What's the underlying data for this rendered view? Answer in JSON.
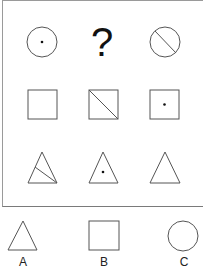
{
  "puzzle": {
    "question_mark": "?",
    "grid": [
      [
        {
          "shape": "circle",
          "mark": "dot"
        },
        {
          "shape": "unknown",
          "mark": "question"
        },
        {
          "shape": "circle",
          "mark": "diagonal-line"
        }
      ],
      [
        {
          "shape": "square",
          "mark": "none"
        },
        {
          "shape": "square",
          "mark": "diagonal-line"
        },
        {
          "shape": "square",
          "mark": "dot"
        }
      ],
      [
        {
          "shape": "triangle",
          "mark": "line"
        },
        {
          "shape": "triangle",
          "mark": "dot"
        },
        {
          "shape": "triangle",
          "mark": "none"
        }
      ]
    ]
  },
  "options": [
    {
      "label": "A",
      "shape": "triangle"
    },
    {
      "label": "B",
      "shape": "square"
    },
    {
      "label": "C",
      "shape": "circle"
    }
  ],
  "colors": {
    "stroke": "#555555",
    "dot": "#111111",
    "border": "#8a8a8a"
  }
}
